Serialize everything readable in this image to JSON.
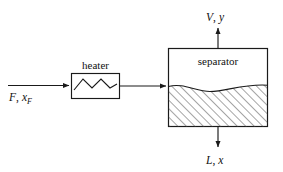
{
  "diagram": {
    "stroke_color": "#1a1a1a",
    "background_color": "#ffffff",
    "hatch_color": "#555555",
    "units": [
      {
        "id": "heater",
        "label": "heater",
        "icon": "zigzag-heating-element"
      },
      {
        "id": "separator",
        "label": "separator",
        "icon": "hatched-liquid-level"
      }
    ],
    "streams": [
      {
        "id": "feed",
        "symbol": "F",
        "composition_symbol": "x",
        "composition_subscript": "F",
        "label": "F, xF",
        "direction": "right",
        "position": "left"
      },
      {
        "id": "vapor",
        "symbol": "V",
        "composition_symbol": "y",
        "composition_subscript": "",
        "label": "V, y",
        "direction": "up",
        "position": "top"
      },
      {
        "id": "liquid",
        "symbol": "L",
        "composition_symbol": "x",
        "composition_subscript": "",
        "label": "L, x",
        "direction": "down",
        "position": "bottom"
      }
    ],
    "separators": {
      "comma": ","
    }
  }
}
